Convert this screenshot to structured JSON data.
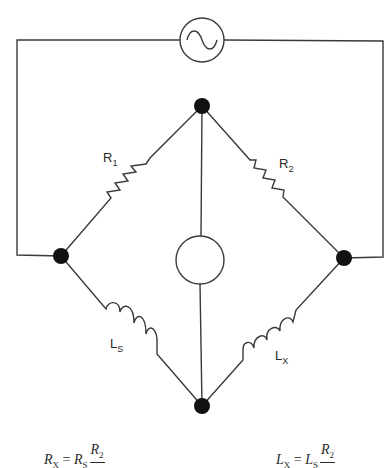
{
  "diagram": {
    "source": {
      "symbol": "ac-source",
      "glyph": "~"
    },
    "detector": {
      "symbol": "null-detector"
    },
    "components": {
      "r1": {
        "name": "R",
        "sub": "1"
      },
      "r2": {
        "name": "R",
        "sub": "2"
      },
      "ls": {
        "name": "L",
        "sub": "S"
      },
      "lx": {
        "name": "L",
        "sub": "X"
      }
    },
    "colors": {
      "line": "#3a3a3a",
      "node": "#111111",
      "background": "#ffffff"
    }
  },
  "formulas": {
    "rx": {
      "lhs": "R",
      "lhs_sub": "X",
      "eq": " = ",
      "rhs": "R",
      "rhs_sub": "S",
      "num": "R",
      "num_sub": "2"
    },
    "lx": {
      "lhs": "L",
      "lhs_sub": "X",
      "eq": " = ",
      "rhs": "L",
      "rhs_sub": "S",
      "num": "R",
      "num_sub": "2"
    }
  }
}
